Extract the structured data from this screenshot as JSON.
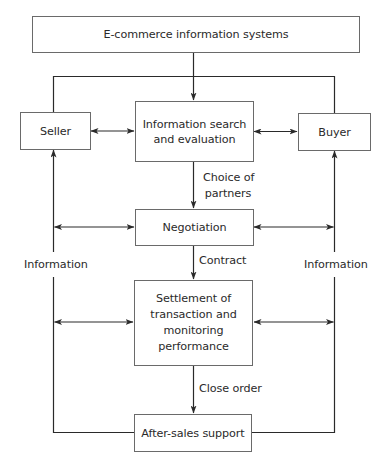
{
  "diagram": {
    "nodes": {
      "ecommerce": "E-commerce information systems",
      "seller": "Seller",
      "buyer": "Buyer",
      "search_line1": "Information search",
      "search_line2": "and evaluation",
      "negotiation": "Negotiation",
      "settlement_line1": "Settlement of",
      "settlement_line2": "transaction and",
      "settlement_line3": "monitoring",
      "settlement_line4": "performance",
      "aftersales": "After-sales support"
    },
    "edge_labels": {
      "choice_line1": "Choice of",
      "choice_line2": "partners",
      "contract": "Contract",
      "close_order": "Close order",
      "information_left": "Information",
      "information_right": "Information"
    },
    "colors": {
      "line": "#2a2a2a",
      "box_border": "#6a6a6a",
      "text": "#2a2a2a"
    }
  }
}
